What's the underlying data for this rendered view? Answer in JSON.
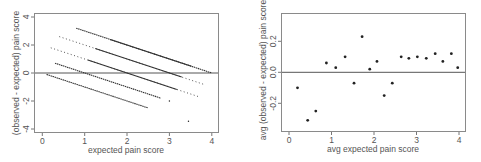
{
  "chart_data": [
    {
      "type": "scatter",
      "title": "",
      "xlabel": "expected pain score",
      "ylabel": "(observed - expected) pain score",
      "xlim": [
        -0.15,
        4.15
      ],
      "ylim": [
        -4.3,
        4.3
      ],
      "xticks": [
        "0",
        "1",
        "2",
        "3",
        "4"
      ],
      "yticks": [
        "-4",
        "-2",
        "0",
        "2",
        "4"
      ],
      "grid": false,
      "reference_line": {
        "y": 0
      },
      "description": "Residuals fall on five diagonal bands y = k - x for observed score k = 0..4",
      "series": [
        {
          "name": "observed=0",
          "x_range": [
            0.1,
            2.5
          ],
          "y_range": [
            -0.1,
            -2.5
          ]
        },
        {
          "name": "observed=1",
          "x_range": [
            0.3,
            2.8
          ],
          "y_range": [
            0.7,
            -1.8
          ]
        },
        {
          "name": "observed=2",
          "x_range": [
            0.2,
            3.7
          ],
          "y_range": [
            1.8,
            -1.7
          ]
        },
        {
          "name": "observed=3",
          "x_range": [
            0.4,
            3.8
          ],
          "y_range": [
            2.6,
            -0.8
          ]
        },
        {
          "name": "observed=4",
          "x_range": [
            0.8,
            4.0
          ],
          "y_range": [
            3.2,
            0.0
          ]
        }
      ],
      "outliers": [
        {
          "x": 3.45,
          "y": -3.45
        },
        {
          "x": 3.0,
          "y": -2.0
        }
      ]
    },
    {
      "type": "scatter",
      "title": "",
      "xlabel": "avg expected pain score",
      "ylabel": "avg (observed - expected) pain score",
      "xlim": [
        -0.15,
        4.15
      ],
      "ylim": [
        -0.38,
        0.38
      ],
      "xticks": [
        "0",
        "1",
        "2",
        "3",
        "4"
      ],
      "yticks": [
        "-0.2",
        "0.0",
        "0.2"
      ],
      "grid": false,
      "reference_line": {
        "y": 0
      },
      "x": [
        0.2,
        0.44,
        0.63,
        0.88,
        1.1,
        1.32,
        1.53,
        1.72,
        1.9,
        2.07,
        2.24,
        2.43,
        2.64,
        2.82,
        3.02,
        3.23,
        3.44,
        3.62,
        3.82,
        3.97
      ],
      "y": [
        -0.1,
        -0.31,
        -0.25,
        0.06,
        0.03,
        0.1,
        -0.07,
        0.23,
        0.02,
        0.07,
        -0.15,
        -0.07,
        0.1,
        0.09,
        0.1,
        0.09,
        0.12,
        0.07,
        0.12,
        0.03
      ]
    }
  ],
  "left": {
    "xlabel": "expected pain score",
    "ylabel": "(observed - expected) pain score",
    "xticks": [
      "0",
      "1",
      "2",
      "3",
      "4"
    ],
    "yticks": [
      "4",
      "2",
      "0",
      "-2",
      "-4"
    ]
  },
  "right": {
    "xlabel": "avg expected pain score",
    "ylabel": "avg (observed - expected) pain score",
    "xticks": [
      "0",
      "1",
      "2",
      "3",
      "4"
    ],
    "yticks": [
      "0.2",
      "0.0",
      "-0.2"
    ]
  }
}
